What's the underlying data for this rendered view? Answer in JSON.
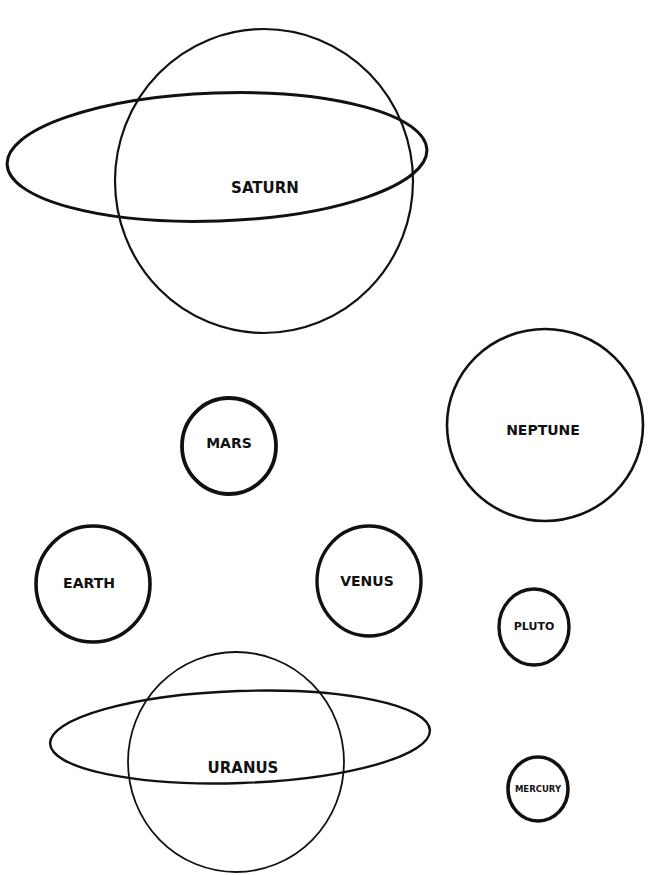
{
  "diagram": {
    "title": "",
    "planets": {
      "saturn": {
        "label": "SATURN",
        "has_ring": true
      },
      "neptune": {
        "label": "NEPTUNE",
        "has_ring": false
      },
      "mars": {
        "label": "MARS",
        "has_ring": false
      },
      "earth": {
        "label": "EARTH",
        "has_ring": false
      },
      "venus": {
        "label": "VENUS",
        "has_ring": false
      },
      "pluto": {
        "label": "PLUTO",
        "has_ring": false
      },
      "uranus": {
        "label": "URANUS",
        "has_ring": true
      },
      "mercury": {
        "label": "MERCURY",
        "has_ring": false
      }
    },
    "colors": {
      "stroke": "#111111",
      "background": "#ffffff"
    }
  }
}
